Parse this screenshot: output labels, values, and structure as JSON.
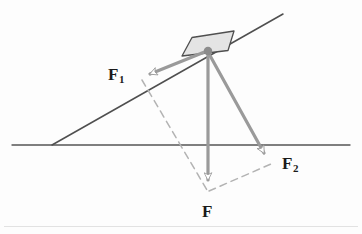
{
  "figure": {
    "background_color": "#fdfdfd",
    "ink_color": "#4a4a4a",
    "line_color": "#555555",
    "vector_color": "#9a9a9a",
    "dashed_color": "#b0b0b0",
    "block_fill": "#e2e2e2",
    "block_stroke": "#4f4f4f",
    "origin_dot_color": "#8c8c8c",
    "artifact_color": "#e0e0e0"
  },
  "labels": {
    "f1": {
      "base": "F",
      "sub": "1"
    },
    "f2": {
      "base": "F",
      "sub": "2"
    },
    "f": {
      "base": "F",
      "sub": ""
    }
  },
  "geometry": {
    "ground_line": {
      "x1": 12,
      "y1": 145,
      "x2": 350,
      "y2": 145
    },
    "incline_line": {
      "x1": 52,
      "y1": 145,
      "x2": 283,
      "y2": 14
    },
    "origin": {
      "x": 208,
      "y": 51
    },
    "block": {
      "corners": "182,56 192,38 234,31 228,51",
      "note": "rectangular block resting on the incline"
    },
    "vectors": [
      {
        "name": "F1",
        "from_x": 208,
        "from_y": 51,
        "to_x": 141,
        "to_y": 78,
        "direction": "up-left along incline"
      },
      {
        "name": "F2",
        "from_x": 208,
        "from_y": 51,
        "to_x": 272,
        "to_y": 166,
        "direction": "down-right"
      },
      {
        "name": "F",
        "from_x": 208,
        "from_y": 51,
        "to_x": 208,
        "to_y": 192,
        "direction": "straight down"
      }
    ],
    "dashed_lines": [
      {
        "x1": 141,
        "y1": 78,
        "x2": 208,
        "y2": 192
      },
      {
        "x1": 272,
        "y1": 166,
        "x2": 208,
        "y2": 192
      }
    ],
    "scan_artifact_line": {
      "x1": 0,
      "y1": 226,
      "x2": 362,
      "y2": 226
    }
  }
}
